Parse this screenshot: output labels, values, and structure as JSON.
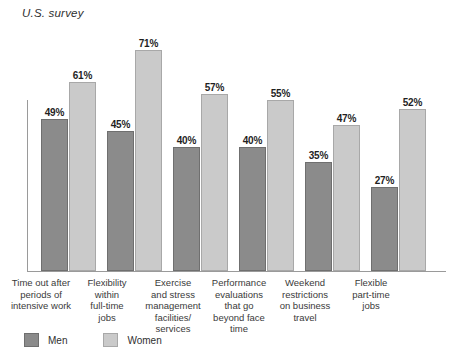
{
  "chart_data": {
    "type": "bar",
    "title": "U.S. survey",
    "xlabel": "",
    "ylabel": "",
    "ylim": [
      0,
      75
    ],
    "grid": false,
    "legend_position": "bottom-left",
    "value_suffix": "%",
    "categories": [
      "Time out after periods of intensive work",
      "Flexibility within full-time jobs",
      "Exercise and stress management facilities/ services",
      "Performance evaluations that go beyond face time",
      "Weekend restrictions on business travel",
      "Flexible part-time jobs"
    ],
    "category_lines": [
      [
        "Time out after",
        "periods of",
        "intensive work"
      ],
      [
        "Flexibility",
        "within",
        "full-time",
        "jobs"
      ],
      [
        "Exercise",
        "and stress",
        "management",
        "facilities/",
        "services"
      ],
      [
        "Performance",
        "evaluations",
        "that go",
        "beyond face",
        "time"
      ],
      [
        "Weekend",
        "restrictions",
        "on business",
        "travel"
      ],
      [
        "Flexible",
        "part-time",
        "jobs"
      ]
    ],
    "series": [
      {
        "name": "Men",
        "color": "#8b8b8b",
        "values": [
          49,
          45,
          40,
          40,
          35,
          27
        ],
        "labels": [
          "49%",
          "45%",
          "40%",
          "40%",
          "35%",
          "27%"
        ]
      },
      {
        "name": "Women",
        "color": "#cacaca",
        "values": [
          61,
          71,
          57,
          55,
          47,
          52
        ],
        "labels": [
          "61%",
          "71%",
          "57%",
          "55%",
          "47%",
          "52%"
        ]
      }
    ]
  },
  "legend": {
    "items": [
      {
        "label": "Men",
        "color": "#8b8b8b"
      },
      {
        "label": "Women",
        "color": "#cacaca"
      }
    ]
  }
}
